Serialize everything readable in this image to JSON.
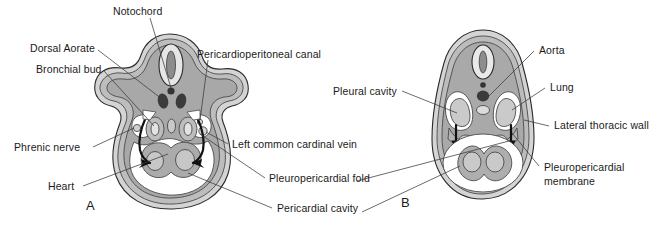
{
  "figure": {
    "type": "anatomical-diagram",
    "panels": [
      {
        "id": "A",
        "letter": "A",
        "labels": [
          {
            "name": "notochord",
            "text": "Notochord"
          },
          {
            "name": "dorsal-aorate",
            "text": "Dorsal Aorate"
          },
          {
            "name": "bronchial-bud",
            "text": "Bronchial bud"
          },
          {
            "name": "pericardioperitoneal-canal",
            "text": "Pericardioperitoneal canal"
          },
          {
            "name": "phrenic-nerve",
            "text": "Phrenic nerve"
          },
          {
            "name": "heart",
            "text": "Heart"
          },
          {
            "name": "left-common-cardinal-vein",
            "text": "Left common cardinal vein"
          },
          {
            "name": "pleuropericardial-fold",
            "text": "Pleuropericardial fold"
          },
          {
            "name": "pericardial-cavity",
            "text": "Pericardial cavity"
          }
        ]
      },
      {
        "id": "B",
        "letter": "B",
        "labels": [
          {
            "name": "pleural-cavity",
            "text": "Pleural cavity"
          },
          {
            "name": "aorta",
            "text": "Aorta"
          },
          {
            "name": "lung",
            "text": "Lung"
          },
          {
            "name": "lateral-thoracic-wall",
            "text": "Lateral thoracic wall"
          },
          {
            "name": "pleuropericardial-membrane-1",
            "text": "Pleuropericardial"
          },
          {
            "name": "pleuropericardial-membrane-2",
            "text": "membrane"
          }
        ]
      }
    ],
    "colors": {
      "outline": "#2b2b2b",
      "leader_line": "#3a3a3a",
      "tissue_light": "#d9d9d9",
      "tissue_mid": "#b8b8b8",
      "tissue_dark": "#9a9a9a",
      "tissue_darker": "#858585",
      "cavity_white": "#ffffff",
      "vessel_dark": "#3c3c3c",
      "text": "#1a1a1a",
      "background": "#ffffff"
    }
  }
}
